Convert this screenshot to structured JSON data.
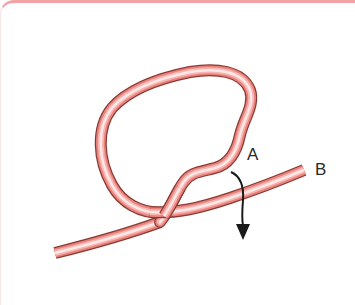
{
  "diagram": {
    "type": "knot-tying-step",
    "labels": {
      "a": "A",
      "b": "B"
    },
    "elements": {
      "rope": "rope-with-loop",
      "arrow": "arrow-down-icon"
    },
    "colors": {
      "frame_border": "#f2a3a6",
      "rope_outline": "#8a3a32",
      "rope_body": "#e8807c",
      "rope_highlight": "#fde8e6",
      "arrow": "#1a1a1a",
      "label": "#2a2a2a",
      "background": "#ffffff"
    }
  }
}
